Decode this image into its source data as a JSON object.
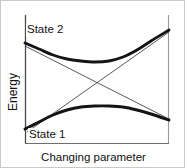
{
  "figure": {
    "kind": "avoided-crossing-energy-diagram",
    "background_color": "#ffffff",
    "border_color": "#c9c9c9",
    "width": 185,
    "height": 168
  },
  "labels": {
    "state_upper": "State 2",
    "state_lower": "State 1",
    "y_axis_title": "Energy",
    "x_axis_title": "Changing parameter"
  },
  "colors": {
    "curve_adiabatic": "#141414",
    "curve_diabatic": "#3a3a3a",
    "axis_left": "#4a4a4a",
    "axis_right": "#9a9a9a",
    "axis_bottom": "#6d6d6d",
    "text": "#111111"
  },
  "chart_data": {
    "type": "line",
    "title": "",
    "xlabel": "Changing parameter",
    "ylabel": "Energy",
    "grid": false,
    "legend": "none",
    "axis_ticks": {
      "x": [],
      "y": []
    },
    "axes_drawn": [
      "left",
      "right",
      "bottom"
    ],
    "xlim": [
      24,
      168
    ],
    "ylim": [
      142,
      14
    ],
    "annotations": [
      {
        "text": "State 2",
        "x": 27,
        "y": 28
      },
      {
        "text": "State 1",
        "x": 29,
        "y": 133
      }
    ],
    "series": [
      {
        "name": "Upper adiabatic branch",
        "style": "thick-solid",
        "points": [
          [
            24,
            42
          ],
          [
            38,
            48
          ],
          [
            52,
            54
          ],
          [
            66,
            58
          ],
          [
            80,
            60
          ],
          [
            94,
            61
          ],
          [
            108,
            60
          ],
          [
            122,
            56
          ],
          [
            136,
            49
          ],
          [
            150,
            40
          ],
          [
            168,
            29
          ]
        ]
      },
      {
        "name": "Lower adiabatic branch",
        "style": "thick-solid",
        "points": [
          [
            24,
            128
          ],
          [
            38,
            121
          ],
          [
            52,
            114
          ],
          [
            66,
            109
          ],
          [
            80,
            106
          ],
          [
            94,
            105
          ],
          [
            108,
            105
          ],
          [
            122,
            106
          ],
          [
            136,
            109
          ],
          [
            150,
            113
          ],
          [
            168,
            119
          ]
        ]
      },
      {
        "name": "Diabatic state 2 (descending)",
        "style": "thin-straight",
        "points": [
          [
            24,
            45
          ],
          [
            168,
            118
          ]
        ]
      },
      {
        "name": "Diabatic state 1 (ascending)",
        "style": "thin-straight",
        "points": [
          [
            26,
            131
          ],
          [
            168,
            31
          ]
        ]
      }
    ],
    "crossing_point": [
      97,
      72
    ]
  }
}
